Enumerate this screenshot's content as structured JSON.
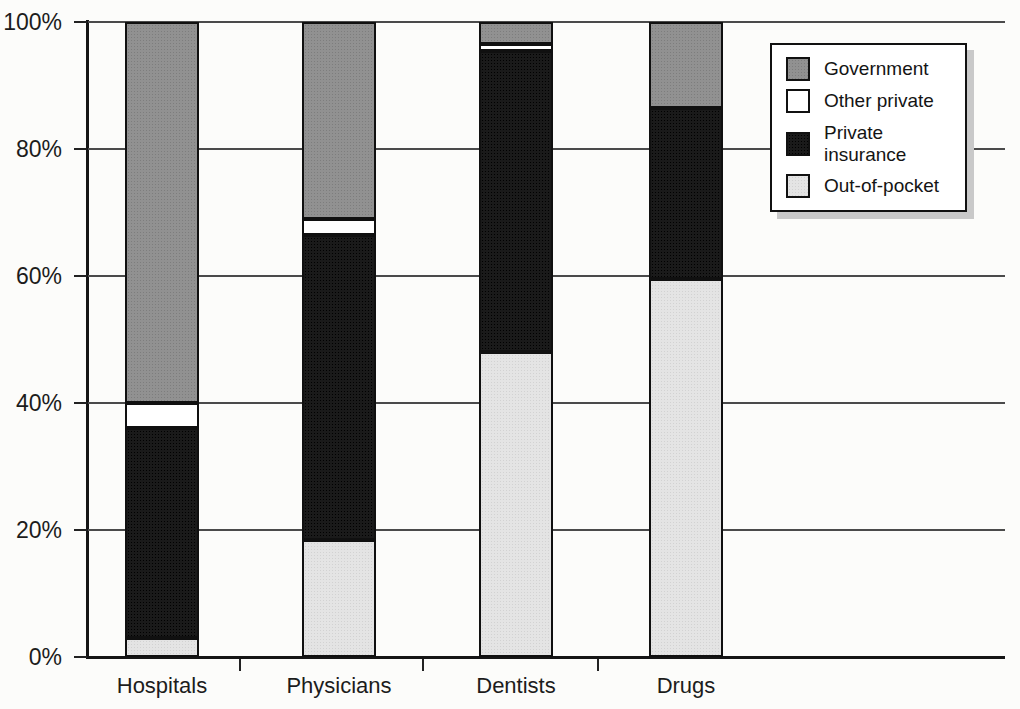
{
  "chart_data": {
    "type": "bar",
    "stacked": true,
    "percent_stacked": true,
    "title": "",
    "xlabel": "",
    "ylabel": "",
    "categories": [
      "Hospitals",
      "Physicians",
      "Dentists",
      "Drugs"
    ],
    "series": [
      {
        "name": "Out-of-pocket",
        "color": "#e4e4e4",
        "values": [
          3,
          18.5,
          48,
          59.5
        ]
      },
      {
        "name": "Private insurance",
        "color": "#161616",
        "values": [
          33,
          48,
          47.5,
          27
        ]
      },
      {
        "name": "Other private",
        "color": "#ffffff",
        "values": [
          4,
          2.5,
          1,
          0
        ]
      },
      {
        "name": "Government",
        "color": "#8f8f8f",
        "values": [
          60,
          31,
          3.5,
          13.5
        ]
      }
    ],
    "y_axis": {
      "min": 0,
      "max": 100,
      "tick_labels": [
        "0%",
        "20%",
        "40%",
        "60%",
        "80%",
        "100%"
      ],
      "tick_step": 20
    },
    "grid": true,
    "legend": {
      "position": "top-right",
      "items": [
        "Government",
        "Other private",
        "Private insurance",
        "Out-of-pocket"
      ]
    },
    "colors": {
      "axis": "#151515",
      "gridline": "#4a4a4a",
      "background": "#fcfcfa",
      "legend_shadow": "#c9c9c9",
      "text": "#1c1c1c"
    }
  }
}
